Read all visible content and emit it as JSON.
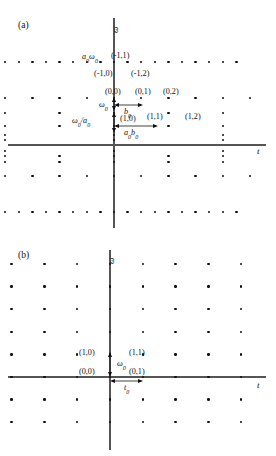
{
  "figure": {
    "type": "diagram"
  },
  "panels": [
    {
      "id": "a",
      "label": "(a)",
      "axis_x_label": "t",
      "axis_y_label": "ω",
      "grid_type": "dyadic",
      "point_labels": [
        {
          "text": "a₀ω₀",
          "x": 82,
          "y": 53
        },
        {
          "text": "(-1,1)",
          "x": 111,
          "y": 52
        },
        {
          "text": "(-1,0)",
          "x": 94,
          "y": 70
        },
        {
          "text": "(-1,2)",
          "x": 131,
          "y": 70
        },
        {
          "text": "(0,0)",
          "x": 105,
          "y": 88
        },
        {
          "text": "(0,1)",
          "x": 135,
          "y": 88
        },
        {
          "text": "(0,2)",
          "x": 163,
          "y": 88
        },
        {
          "text": "ω₀",
          "x": 99,
          "y": 101
        },
        {
          "text": "b₀",
          "x": 124,
          "y": 108
        },
        {
          "text": "(1,0)",
          "x": 120,
          "y": 115
        },
        {
          "text": "(1,1)",
          "x": 147,
          "y": 113
        },
        {
          "text": "(1,2)",
          "x": 185,
          "y": 113
        },
        {
          "text": "ω₀/a₀",
          "x": 72,
          "y": 117
        },
        {
          "text": "a₀b₀",
          "x": 124,
          "y": 129
        }
      ],
      "arrows": [
        {
          "name": "b0-horizontal",
          "x1": 114,
          "y1": 105,
          "x2": 142,
          "y2": 105,
          "heads": "both"
        },
        {
          "name": "a0b0-horizontal",
          "x1": 114,
          "y1": 126,
          "x2": 157,
          "y2": 126,
          "heads": "both"
        },
        {
          "name": "omega0-vertical",
          "x1": 114,
          "y1": 98,
          "x2": 114,
          "y2": 110,
          "heads": "both"
        },
        {
          "name": "omega0-over-a0-vertical",
          "x1": 114,
          "y1": 112,
          "x2": 114,
          "y2": 133,
          "heads": "both"
        }
      ]
    },
    {
      "id": "b",
      "label": "(b)",
      "axis_x_label": "t",
      "axis_y_label": "ω",
      "grid_type": "uniform",
      "point_labels": [
        {
          "text": "(1,0)",
          "x": 79,
          "y": 349
        },
        {
          "text": "(1,1)",
          "x": 129,
          "y": 349
        },
        {
          "text": "(0,0)",
          "x": 79,
          "y": 368
        },
        {
          "text": "(0,1)",
          "x": 129,
          "y": 368
        },
        {
          "text": "ω₀",
          "x": 117,
          "y": 360
        },
        {
          "text": "t₀",
          "x": 124,
          "y": 384
        }
      ],
      "arrows": [
        {
          "name": "t0-horizontal",
          "x1": 110,
          "y1": 381,
          "x2": 143,
          "y2": 381,
          "heads": "both"
        },
        {
          "name": "omega0-vertical",
          "x1": 110,
          "y1": 352,
          "x2": 110,
          "y2": 377,
          "heads": "both"
        }
      ]
    }
  ],
  "chart_data": {
    "type": "scatter",
    "title": "",
    "xlabel": "t",
    "ylabel": "ω",
    "panel_a": {
      "label": "(a)",
      "description": "Dyadic / wavelet lattice: sample density in t doubles as scale index increases",
      "origin_px": {
        "x": 114,
        "y": 145
      },
      "axis_x_px": {
        "x1": 8,
        "x2": 266,
        "y": 145
      },
      "axis_y_px": {
        "x": 114,
        "y1": 18,
        "y2": 228
      },
      "rows": [
        {
          "scale": -1,
          "y": 62,
          "spacing": 13.6,
          "count": 19,
          "start_x": 18
        },
        {
          "scale": 0,
          "y": 98,
          "spacing": 27.2,
          "count": 10,
          "start_x": 18
        },
        {
          "scale": 1,
          "y": 113,
          "spacing": 54.4,
          "count": 5,
          "start_x": 5
        },
        {
          "scale": 2,
          "y": 126,
          "spacing": 54.4,
          "count": 5,
          "start_x": 5
        },
        {
          "scale": 3,
          "y": 135,
          "spacing": 108.8,
          "count": 3,
          "start_x": 5
        },
        {
          "scale": 4,
          "y": 140,
          "spacing": 108.8,
          "count": 3,
          "start_x": 5
        },
        {
          "scale": 5,
          "y": 151,
          "spacing": 108.8,
          "count": 3,
          "start_x": 5
        },
        {
          "scale": 6,
          "y": 156,
          "spacing": 54.4,
          "count": 5,
          "start_x": 5
        },
        {
          "scale": 7,
          "y": 162,
          "spacing": 54.4,
          "count": 5,
          "start_x": 5
        },
        {
          "scale": 8,
          "y": 176,
          "spacing": 27.2,
          "count": 10,
          "start_x": 18
        },
        {
          "scale": 9,
          "y": 212,
          "spacing": 13.6,
          "count": 19,
          "start_x": 18
        }
      ],
      "annotations": [
        "a₀ω₀",
        "ω₀",
        "ω₀/a₀",
        "b₀",
        "a₀b₀"
      ],
      "indices": [
        "(-1,0)",
        "(-1,1)",
        "(-1,2)",
        "(0,0)",
        "(0,1)",
        "(0,2)",
        "(1,0)",
        "(1,1)",
        "(1,2)"
      ]
    },
    "panel_b": {
      "label": "(b)",
      "description": "Uniform / short-time Fourier lattice: equal spacing t₀ in time and ω₀ in frequency",
      "origin_px": {
        "x": 110,
        "y": 377
      },
      "axis_x_px": {
        "x1": 8,
        "x2": 266,
        "y": 377
      },
      "axis_y_px": {
        "x": 110,
        "y1": 250,
        "y2": 450
      },
      "dx": 32.8,
      "dy": 22.6,
      "cols": [
        -3,
        -2,
        -1,
        0,
        1,
        2,
        3,
        4
      ],
      "rows_idx": [
        -2,
        -1,
        0,
        1,
        2,
        3,
        4,
        5
      ],
      "annotations": [
        "ω₀",
        "t₀"
      ],
      "indices": [
        "(0,0)",
        "(0,1)",
        "(1,0)",
        "(1,1)"
      ]
    }
  }
}
